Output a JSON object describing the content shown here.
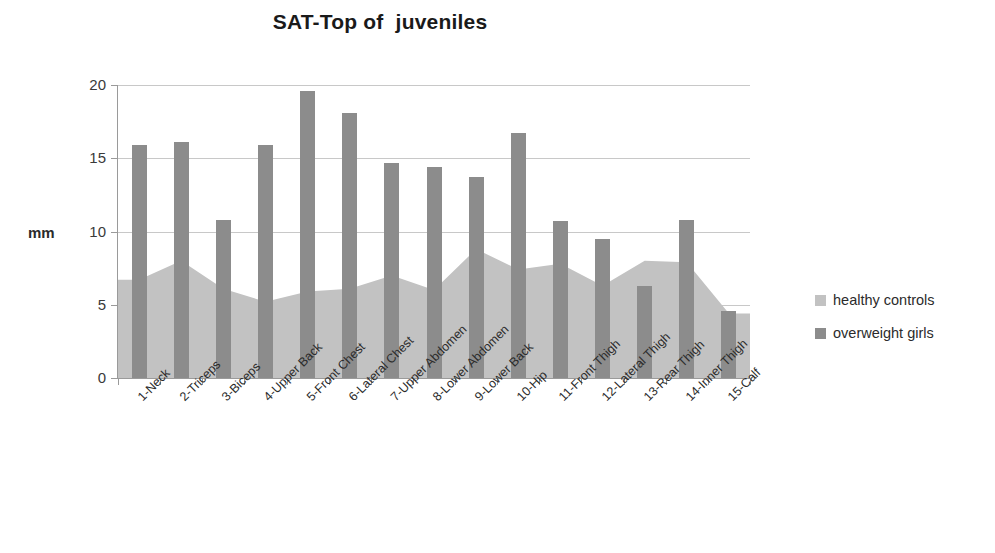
{
  "chart_data": {
    "type": "bar",
    "title": "SAT-Top of  juveniles",
    "xlabel": "",
    "ylabel": "mm",
    "ylim": [
      0,
      20
    ],
    "yticks": [
      0,
      5,
      10,
      15,
      20
    ],
    "grid": true,
    "legend_position": "right",
    "categories": [
      "1-Neck",
      "2-Triceps",
      "3-Biceps",
      "4-Upper Back",
      "5-Front Chest",
      "6-Lateral Chest",
      "7-Upper Abdomen",
      "8-Lower Abdomen",
      "9-Lower Back",
      "10-Hip",
      "11-Front Thigh",
      "12-Lateral Thigh",
      "13-Rear Thigh",
      "14-Inner Thigh",
      "15-Calf"
    ],
    "series": [
      {
        "name": "healthy controls",
        "render": "area",
        "color": "#c2c2c2",
        "values": [
          6.7,
          8.0,
          6.1,
          5.2,
          5.9,
          6.1,
          7.0,
          6.0,
          8.8,
          7.4,
          7.8,
          6.3,
          8.0,
          7.9,
          4.4
        ]
      },
      {
        "name": "overweight girls",
        "render": "bar",
        "color": "#8c8c8c",
        "values": [
          15.9,
          16.1,
          10.8,
          15.9,
          19.6,
          18.1,
          14.7,
          14.4,
          13.7,
          16.7,
          10.7,
          9.5,
          6.3,
          10.8,
          4.6
        ]
      }
    ]
  },
  "legend": {
    "items": [
      {
        "label": "healthy controls",
        "color": "#c2c2c2"
      },
      {
        "label": "overweight girls",
        "color": "#8c8c8c"
      }
    ]
  }
}
